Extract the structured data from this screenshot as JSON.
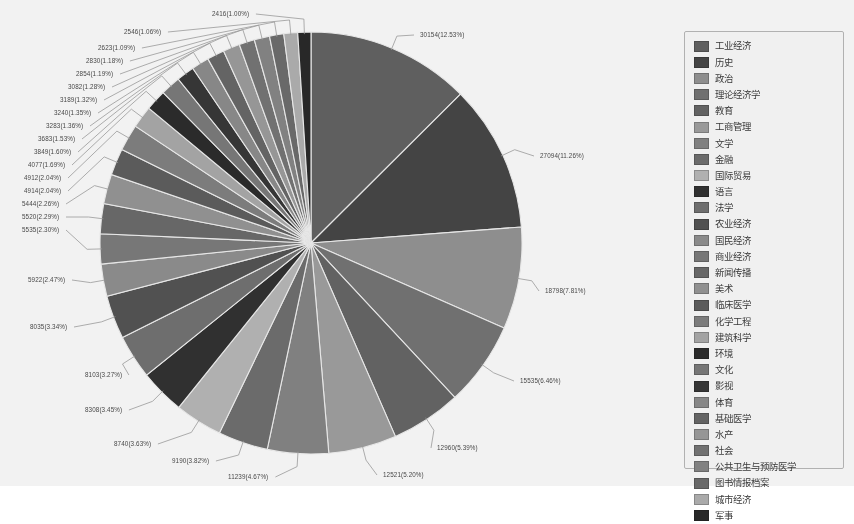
{
  "chart_data": {
    "type": "pie",
    "title": "",
    "xlabel": "",
    "ylabel": "",
    "legend_position": "right",
    "grid": false,
    "label_format": "value(percent%)",
    "total": 240700,
    "categories": [
      "工业经济",
      "历史",
      "政治",
      "理论经济学",
      "教育",
      "工商管理",
      "文学",
      "金融",
      "国际贸易",
      "语言",
      "法学",
      "农业经济",
      "国民经济",
      "商业经济",
      "新闻传播",
      "美术",
      "临床医学",
      "化学工程",
      "建筑科学",
      "环境",
      "文化",
      "影视",
      "体育",
      "基础医学",
      "水产",
      "社会",
      "公共卫生与预防医学",
      "图书情报档案",
      "城市经济",
      "军事"
    ],
    "values": [
      30154,
      27094,
      18798,
      15535,
      12960,
      12521,
      11239,
      9190,
      8740,
      8308,
      8103,
      8035,
      5922,
      5535,
      5520,
      5444,
      4914,
      4912,
      4077,
      3849,
      3683,
      3283,
      3240,
      3189,
      3082,
      2854,
      2830,
      2623,
      2546,
      2416
    ],
    "percents": [
      12.53,
      11.26,
      7.81,
      6.46,
      5.39,
      5.2,
      4.67,
      3.82,
      3.63,
      3.45,
      3.27,
      3.34,
      2.47,
      2.3,
      2.29,
      2.26,
      2.04,
      2.04,
      1.69,
      1.6,
      1.53,
      1.36,
      1.35,
      1.32,
      1.28,
      1.19,
      1.18,
      1.09,
      1.06,
      1.0
    ],
    "point_labels": [
      "30154(12.53%)",
      "27094(11.26%)",
      "18798(7.81%)",
      "15535(6.46%)",
      "12960(5.39%)",
      "12521(5.20%)",
      "11239(4.67%)",
      "9190(3.82%)",
      "8740(3.63%)",
      "8308(3.45%)",
      "8103(3.27%)",
      "8035(3.34%)",
      "5922(2.47%)",
      "5535(2.30%)",
      "5520(2.29%)",
      "5444(2.26%)",
      "4914(2.04%)",
      "4912(2.04%)",
      "4077(1.69%)",
      "3849(1.60%)",
      "3683(1.53%)",
      "3283(1.36%)",
      "3240(1.35%)",
      "3189(1.32%)",
      "3082(1.28%)",
      "2854(1.19%)",
      "2830(1.18%)",
      "2623(1.09%)",
      "2546(1.06%)",
      "2416(1.00%)"
    ],
    "colors": [
      "#59595b",
      "#3b3b3d",
      "#8e8e90",
      "#6d6d6f",
      "#5d5d5f",
      "#9b9b9d",
      "#7f7f81",
      "#676769",
      "#b4b4b6",
      "#242426",
      "#6a6a6c",
      "#4a4a4c",
      "#8a8a8c",
      "#747476",
      "#626264",
      "#90909 2",
      "#555557",
      "#7a7a7c",
      "#a6a6a8",
      "#1f1f21",
      "#737375",
      "#2b2b2d",
      "#86868 8",
      "#5f5f61",
      "#9797 99",
      "#6e6e70",
      "#808082",
      "#65656 7",
      "#aeaeb0",
      "#1c1c1e"
    ]
  },
  "legend": {
    "items": [
      {
        "label": "工业经济",
        "color": "#59595b"
      },
      {
        "label": "历史",
        "color": "#3b3b3d"
      },
      {
        "label": "政治",
        "color": "#8e8e90"
      },
      {
        "label": "理论经济学",
        "color": "#6d6d6f"
      },
      {
        "label": "教育",
        "color": "#5d5d5f"
      },
      {
        "label": "工商管理",
        "color": "#9b9b9d"
      },
      {
        "label": "文学",
        "color": "#7f7f81"
      },
      {
        "label": "金融",
        "color": "#676769"
      },
      {
        "label": "国际贸易",
        "color": "#b4b4b6"
      },
      {
        "label": "语言",
        "color": "#242426"
      },
      {
        "label": "法学",
        "color": "#6a6a6c"
      },
      {
        "label": "农业经济",
        "color": "#4a4a4c"
      },
      {
        "label": "国民经济",
        "color": "#8a8a8c"
      },
      {
        "label": "商业经济",
        "color": "#747476"
      },
      {
        "label": "新闻传播",
        "color": "#626264"
      },
      {
        "label": "美术",
        "color": "#909092"
      },
      {
        "label": "临床医学",
        "color": "#555557"
      },
      {
        "label": "化学工程",
        "color": "#7a7a7c"
      },
      {
        "label": "建筑科学",
        "color": "#a6a6a8"
      },
      {
        "label": "环境",
        "color": "#1f1f21"
      },
      {
        "label": "文化",
        "color": "#737375"
      },
      {
        "label": "影视",
        "color": "#2b2b2d"
      },
      {
        "label": "体育",
        "color": "#868688"
      },
      {
        "label": "基础医学",
        "color": "#5f5f61"
      },
      {
        "label": "水产",
        "color": "#979799"
      },
      {
        "label": "社会",
        "color": "#6e6e70"
      },
      {
        "label": "公共卫生与预防医学",
        "color": "#808082"
      },
      {
        "label": "图书情报档案",
        "color": "#656567"
      },
      {
        "label": "城市经济",
        "color": "#aeaeb0"
      },
      {
        "label": "军事",
        "color": "#1c1c1e"
      }
    ]
  }
}
